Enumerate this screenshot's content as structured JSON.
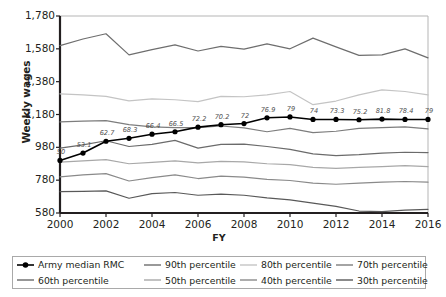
{
  "chart_data": {
    "type": "line",
    "title": "",
    "xlabel": "FY",
    "ylabel": "Weekly wages",
    "x": [
      2000,
      2001,
      2002,
      2003,
      2004,
      2005,
      2006,
      2007,
      2008,
      2009,
      2010,
      2011,
      2012,
      2013,
      2014,
      2015,
      2016
    ],
    "xtick_labels": [
      "2000",
      "2002",
      "2004",
      "2006",
      "2008",
      "2010",
      "2012",
      "2014",
      "2016"
    ],
    "xticks": [
      2000,
      2002,
      2004,
      2006,
      2008,
      2010,
      2012,
      2014,
      2016
    ],
    "xlim": [
      2000,
      2016
    ],
    "ytick_labels": [
      "580",
      "780",
      "980",
      "1,180",
      "1,380",
      "1,580",
      "1,780"
    ],
    "yticks": [
      580,
      780,
      980,
      1180,
      1380,
      1580,
      1780
    ],
    "ylim": [
      580,
      1780
    ],
    "grid": false,
    "legend_position": "bottom",
    "series": [
      {
        "name": "Army median RMC",
        "color": "#000000",
        "width": 1.6,
        "markers": true,
        "values": [
          900,
          945,
          1017,
          1035,
          1060,
          1075,
          1103,
          1118,
          1125,
          1160,
          1165,
          1150,
          1150,
          1148,
          1152,
          1150,
          1150
        ],
        "point_labels": [
          "50",
          "53.1",
          "62.7",
          "68.3",
          "66.4",
          "66.5",
          "72.2",
          "70.2",
          "72",
          "76.9",
          "79",
          "74",
          "73.3",
          "75.2",
          "81.8",
          "78.4",
          "79"
        ]
      },
      {
        "name": "90th percentile",
        "color": "#6e6e6e",
        "width": 1.2,
        "markers": false,
        "values": [
          1600,
          1640,
          1672,
          1543,
          1575,
          1604,
          1567,
          1595,
          1578,
          1610,
          1580,
          1645,
          1592,
          1540,
          1543,
          1580,
          1525
        ]
      },
      {
        "name": "80th percentile",
        "color": "#c4c4c4",
        "width": 1.2,
        "markers": false,
        "values": [
          1306,
          1300,
          1290,
          1263,
          1275,
          1270,
          1258,
          1290,
          1288,
          1300,
          1320,
          1240,
          1262,
          1300,
          1330,
          1320,
          1300
        ]
      },
      {
        "name": "70th percentile",
        "color": "#7d7d7d",
        "width": 1.2,
        "markers": false,
        "values": [
          1135,
          1140,
          1143,
          1118,
          1105,
          1100,
          1100,
          1110,
          1098,
          1075,
          1095,
          1070,
          1078,
          1095,
          1100,
          1105,
          1092
        ]
      },
      {
        "name": "60th percentile",
        "color": "#6b6b6b",
        "width": 1.2,
        "markers": false,
        "values": [
          975,
          995,
          1020,
          985,
          998,
          1022,
          975,
          998,
          1000,
          985,
          968,
          940,
          930,
          935,
          945,
          950,
          948
        ]
      },
      {
        "name": "50th percentile",
        "color": "#a8a8a8",
        "width": 1.2,
        "markers": false,
        "values": [
          890,
          898,
          905,
          880,
          888,
          898,
          885,
          895,
          892,
          880,
          875,
          858,
          852,
          858,
          862,
          868,
          862
        ]
      },
      {
        "name": "40th percentile",
        "color": "#8a8a8a",
        "width": 1.2,
        "markers": false,
        "values": [
          800,
          812,
          820,
          775,
          795,
          812,
          790,
          805,
          798,
          785,
          778,
          762,
          755,
          762,
          768,
          772,
          768
        ]
      },
      {
        "name": "30th percentile",
        "color": "#595959",
        "width": 1.2,
        "markers": false,
        "values": [
          710,
          712,
          715,
          670,
          698,
          705,
          688,
          695,
          688,
          672,
          660,
          640,
          620,
          592,
          588,
          598,
          602
        ]
      }
    ]
  },
  "axis": {
    "y_title": "Weekly wages",
    "x_title": "FY"
  },
  "legend": {
    "items": [
      {
        "label": "Army median RMC",
        "color": "#000000",
        "marker": true
      },
      {
        "label": "90th percentile",
        "color": "#6e6e6e",
        "marker": false
      },
      {
        "label": "80th percentile",
        "color": "#c4c4c4",
        "marker": false
      },
      {
        "label": "70th percentile",
        "color": "#7d7d7d",
        "marker": false
      },
      {
        "label": "60th percentile",
        "color": "#6b6b6b",
        "marker": false
      },
      {
        "label": "50th percentile",
        "color": "#a8a8a8",
        "marker": false
      },
      {
        "label": "40th percentile",
        "color": "#8a8a8a",
        "marker": false
      },
      {
        "label": "30th percentile",
        "color": "#595959",
        "marker": false
      }
    ]
  }
}
